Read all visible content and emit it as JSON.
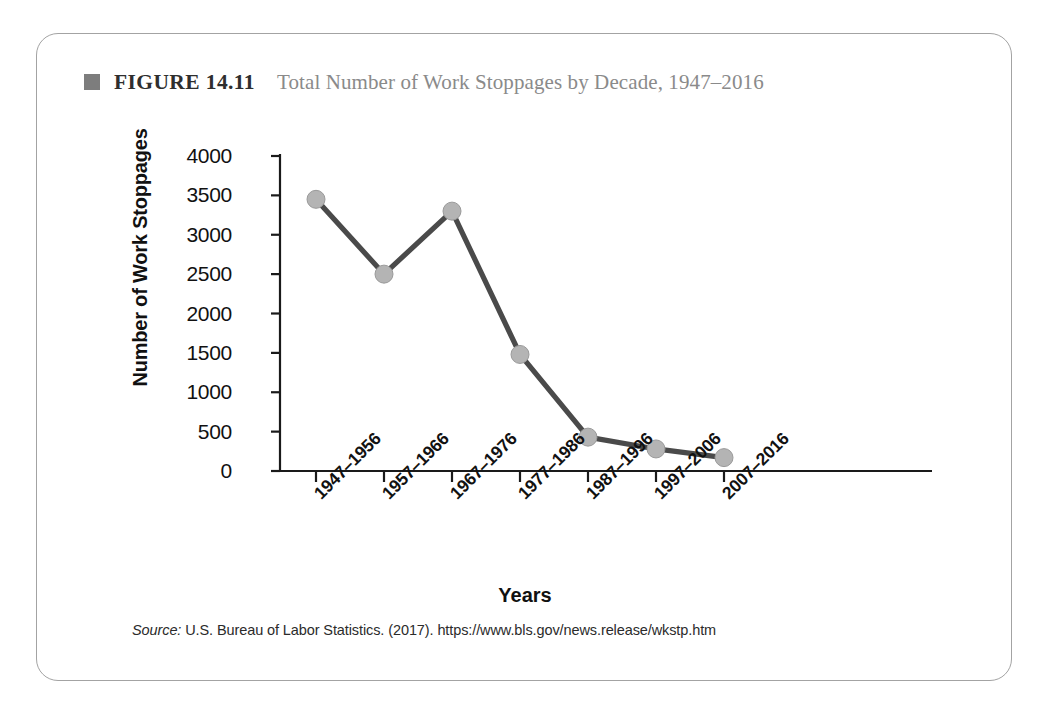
{
  "figure": {
    "bullet_icon": "filled-square-icon",
    "number_label": "FIGURE 14.11",
    "title": "Total Number of Work Stoppages by Decade, 1947–2016",
    "source_label": "Source:",
    "source_text": " U.S. Bureau of Labor Statistics. (2017). https://www.bls.gov/news.release/wkstp.htm"
  },
  "colors": {
    "line": "#4a4a4a",
    "marker": "#b4b4b4",
    "marker_edge": "#9a9a9a",
    "axis": "#1a1a1a",
    "card_border": "#a3a3a3",
    "title_gray": "#8a8a8a",
    "bullet": "#7d7d7d"
  },
  "chart_data": {
    "type": "line",
    "title": "Total Number of Work Stoppages by Decade, 1947–2016",
    "xlabel": "Years",
    "ylabel": "Number of Work Stoppages",
    "categories": [
      "1947–1956",
      "1957–1966",
      "1967–1976",
      "1977–1986",
      "1987–1996",
      "1997–2006",
      "2007–2016"
    ],
    "values": [
      3450,
      2500,
      3300,
      1480,
      430,
      280,
      170
    ],
    "ylim": [
      0,
      4000
    ],
    "yticks": [
      0,
      500,
      1000,
      1500,
      2000,
      2500,
      3000,
      3500,
      4000
    ],
    "ytick_labels": [
      "0",
      "500",
      "1000",
      "1500",
      "2000",
      "2500",
      "3000",
      "3500",
      "4000"
    ],
    "grid": false,
    "legend": false,
    "markers": "circle"
  }
}
